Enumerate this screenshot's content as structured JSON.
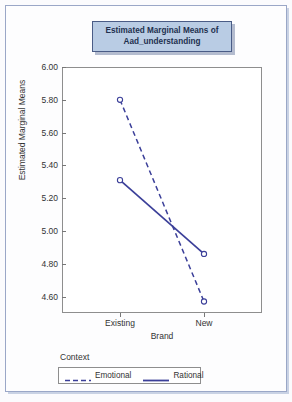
{
  "chart_data": {
    "type": "line",
    "title": "Estimated Marginal Means of Aad_understanding",
    "title_line1": "Estimated Marginal Means of",
    "title_line2": "Aad_understanding",
    "xlabel": "Brand",
    "ylabel": "Estimated Marginal Means",
    "categories": [
      "Existing",
      "New"
    ],
    "ylim": [
      4.5,
      6.0
    ],
    "yticks": [
      "6.00",
      "5.80",
      "5.60",
      "5.40",
      "5.20",
      "5.00",
      "4.80",
      "4.60"
    ],
    "ytick_values": [
      6.0,
      5.8,
      5.6,
      5.4,
      5.2,
      5.0,
      4.8,
      4.6
    ],
    "grid": false,
    "legend_position": "bottom",
    "legend_title": "Context",
    "series": [
      {
        "name": "Emotional",
        "values": [
          5.8,
          4.57
        ],
        "style": "dashed",
        "color": "#3b3f99",
        "marker": "open-circle"
      },
      {
        "name": "Rational",
        "values": [
          5.31,
          4.86
        ],
        "style": "solid",
        "color": "#3b3f99",
        "marker": "open-circle"
      }
    ]
  },
  "colors": {
    "series_line": "#3b3f99",
    "title_fill": "#b9cce4",
    "title_border": "#4a5c86",
    "outer_border": "#9aa7c7",
    "plot_border": "#8e8e8e"
  }
}
